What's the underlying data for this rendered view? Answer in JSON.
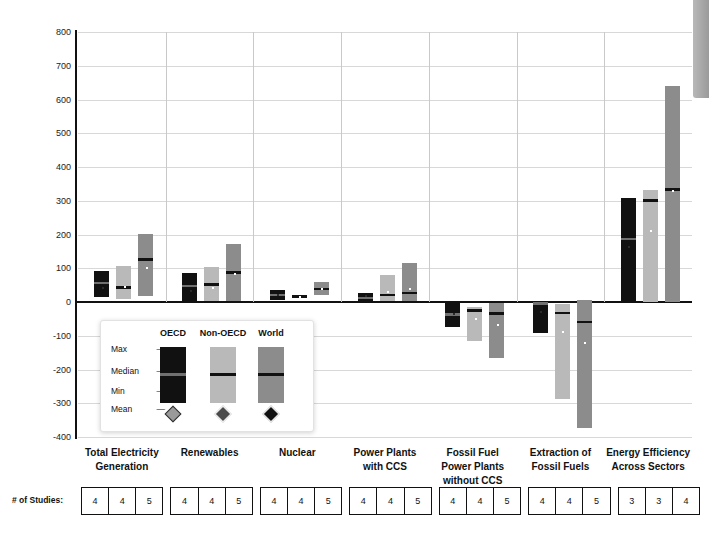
{
  "chart_data": {
    "type": "bar",
    "title": "",
    "ylabel": "Changes in Annual Investment Flows 2010-2029 [USD2010 Billion /yr]",
    "ylabel_prefix": "Changes in Annual Investment Flows 2010-2029 [USD",
    "ylabel_sub": "2010",
    "ylabel_suffix": " Billion /yr]",
    "xlabel": "",
    "ylim": [
      -400,
      800
    ],
    "yticks": [
      800,
      700,
      600,
      500,
      400,
      300,
      200,
      100,
      0,
      -100,
      -200,
      -300,
      -400
    ],
    "grid": true,
    "legend_position": "inside-lower-left",
    "categories": [
      "Total Electricity Generation",
      "Renewables",
      "Nuclear",
      "Power Plants with CCS",
      "Fossil Fuel Power Plants without CCS",
      "Extraction of Fossil Fuels",
      "Energy Efficiency Across Sectors"
    ],
    "category_lines": [
      [
        "Total Electricity",
        "Generation"
      ],
      [
        "Renewables"
      ],
      [
        "Nuclear"
      ],
      [
        "Power Plants",
        "with CCS"
      ],
      [
        "Fossil Fuel",
        "Power Plants",
        "without CCS"
      ],
      [
        "Extraction of",
        "Fossil Fuels"
      ],
      [
        "Energy Efficiency",
        "Across Sectors"
      ]
    ],
    "series": [
      {
        "name": "OECD",
        "color": "#111111"
      },
      {
        "name": "Non-OECD",
        "color": "#b9b9b9"
      },
      {
        "name": "World",
        "color": "#8c8c8c"
      }
    ],
    "groups": [
      {
        "category": "Total Electricity Generation",
        "bars": [
          {
            "series": "OECD",
            "min": 15,
            "max": 92,
            "median": 57,
            "mean": 45
          },
          {
            "series": "Non-OECD",
            "min": 8,
            "max": 107,
            "median": 44,
            "mean": 48
          },
          {
            "series": "World",
            "min": 18,
            "max": 202,
            "median": 126,
            "mean": 104
          }
        ]
      },
      {
        "category": "Renewables",
        "bars": [
          {
            "series": "OECD",
            "min": 2,
            "max": 87,
            "median": 48,
            "mean": 36
          },
          {
            "series": "Non-OECD",
            "min": 2,
            "max": 103,
            "median": 52,
            "mean": 45
          },
          {
            "series": "World",
            "min": 2,
            "max": 172,
            "median": 88,
            "mean": 85
          }
        ]
      },
      {
        "category": "Nuclear",
        "bars": [
          {
            "series": "OECD",
            "min": 6,
            "max": 37,
            "median": 21,
            "mean": 25
          },
          {
            "series": "Non-OECD",
            "min": 13,
            "max": 22,
            "median": 17,
            "mean": 18
          },
          {
            "series": "World",
            "min": 20,
            "max": 58,
            "median": 39,
            "mean": 42
          }
        ]
      },
      {
        "category": "Power Plants with CCS",
        "bars": [
          {
            "series": "OECD",
            "min": 1,
            "max": 28,
            "median": 13,
            "mean": 22
          },
          {
            "series": "Non-OECD",
            "min": 2,
            "max": 81,
            "median": 22,
            "mean": 33
          },
          {
            "series": "World",
            "min": 3,
            "max": 116,
            "median": 28,
            "mean": 42
          }
        ]
      },
      {
        "category": "Fossil Fuel Power Plants without CCS",
        "bars": [
          {
            "series": "OECD",
            "min": -74,
            "max": 0,
            "median": -36,
            "mean": -32
          },
          {
            "series": "Non-OECD",
            "min": -116,
            "max": -15,
            "median": -24,
            "mean": -46
          },
          {
            "series": "World",
            "min": -166,
            "max": -2,
            "median": -34,
            "mean": -64
          }
        ]
      },
      {
        "category": "Extraction of Fossil Fuels",
        "bars": [
          {
            "series": "OECD",
            "min": -92,
            "max": -2,
            "median": -4,
            "mean": -28
          },
          {
            "series": "Non-OECD",
            "min": -286,
            "max": -6,
            "median": -32,
            "mean": -85
          },
          {
            "series": "World",
            "min": -374,
            "max": 6,
            "median": -58,
            "mean": -118
          }
        ]
      },
      {
        "category": "Energy Efficiency Across Sectors",
        "bars": [
          {
            "series": "OECD",
            "min": 0,
            "max": 308,
            "median": 188,
            "mean": 165
          },
          {
            "series": "Non-OECD",
            "min": 0,
            "max": 331,
            "median": 302,
            "mean": 212
          },
          {
            "series": "World",
            "min": 0,
            "max": 640,
            "median": 334,
            "mean": 331
          }
        ]
      }
    ]
  },
  "legend": {
    "headers": [
      "OECD",
      "Non-OECD",
      "World"
    ],
    "rows": [
      "Max",
      "Median",
      "Min",
      "Mean"
    ],
    "dash": "—"
  },
  "studies": {
    "label": "# of Studies:",
    "counts": [
      [
        4,
        4,
        5
      ],
      [
        4,
        4,
        5
      ],
      [
        4,
        4,
        5
      ],
      [
        4,
        4,
        5
      ],
      [
        4,
        4,
        5
      ],
      [
        4,
        4,
        5
      ],
      [
        3,
        3,
        4
      ]
    ]
  }
}
